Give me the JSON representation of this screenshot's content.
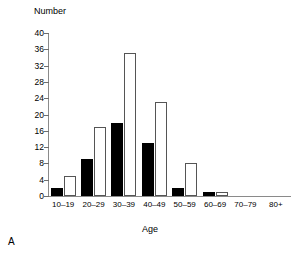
{
  "chart_data": {
    "type": "bar",
    "title": "",
    "panel_label": "A",
    "xlabel": "Age",
    "ylabel": "Number",
    "categories": [
      "10–19",
      "20–29",
      "30–39",
      "40–49",
      "50–59",
      "60–69",
      "70–79",
      "80+"
    ],
    "series": [
      {
        "name": "solid",
        "style": "filled-black",
        "values": [
          2,
          9,
          18,
          13,
          2,
          1,
          0,
          0
        ]
      },
      {
        "name": "hollow",
        "style": "open-white",
        "values": [
          5,
          17,
          35,
          23,
          8,
          1,
          0,
          0
        ]
      }
    ],
    "ylim": [
      0,
      40
    ],
    "ytick_step": 4,
    "yticks": [
      0,
      4,
      8,
      12,
      16,
      20,
      24,
      28,
      32,
      36,
      40
    ],
    "ytick_labels": [
      "0",
      "4",
      "8",
      "12",
      "16",
      "20",
      "24",
      "28",
      "32",
      "36",
      "40"
    ],
    "grid": false,
    "legend": "none",
    "legend_position": "none",
    "colors": {
      "solid_fill": "#000000",
      "hollow_fill": "#ffffff",
      "hollow_stroke": "#555555",
      "axis": "#8a8a8a",
      "text": "#000000",
      "background": "#ffffff"
    }
  }
}
